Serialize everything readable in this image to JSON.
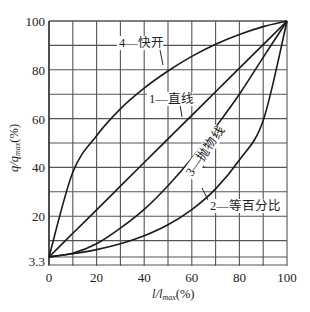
{
  "chart_data": {
    "type": "line",
    "title": "",
    "xlabel": "l/l_max(%)",
    "ylabel": "q/q_max(%)",
    "xlim": [
      0,
      100
    ],
    "ylim": [
      0,
      100
    ],
    "grid": true,
    "x_ticks": [
      0,
      20,
      40,
      60,
      80,
      100
    ],
    "y_ticks": [
      3.3,
      20,
      40,
      60,
      80,
      100
    ],
    "x": [
      0,
      10,
      20,
      30,
      40,
      50,
      60,
      70,
      80,
      90,
      100
    ],
    "series": [
      {
        "name": "1—直线",
        "values": [
          3.3,
          13,
          22.6,
          32.3,
          42,
          51.7,
          61.3,
          71,
          80.7,
          90.3,
          100
        ]
      },
      {
        "name": "2—等百分比",
        "values": [
          3.3,
          4.6,
          6.3,
          8.7,
          12.0,
          16.5,
          22.7,
          31.2,
          43.0,
          59.2,
          100
        ]
      },
      {
        "name": "3—抛物线",
        "values": [
          3.3,
          4.8,
          8.7,
          15.1,
          22.8,
          32.5,
          43.6,
          56.5,
          70.0,
          85.1,
          100
        ]
      },
      {
        "name": "4—快开",
        "values": [
          3.3,
          38,
          53,
          64,
          72.5,
          79.5,
          85.5,
          90.5,
          94.5,
          97.7,
          100
        ]
      }
    ],
    "annotations": [
      "4—快开",
      "1—直线",
      "3—抛物线",
      "2—等百分比"
    ]
  },
  "labels": {
    "x_axis": "l/l",
    "x_axis_sub": "max",
    "x_axis_unit": "(%)",
    "y_axis": "q/q",
    "y_axis_sub": "max",
    "y_axis_unit": "(%)"
  }
}
